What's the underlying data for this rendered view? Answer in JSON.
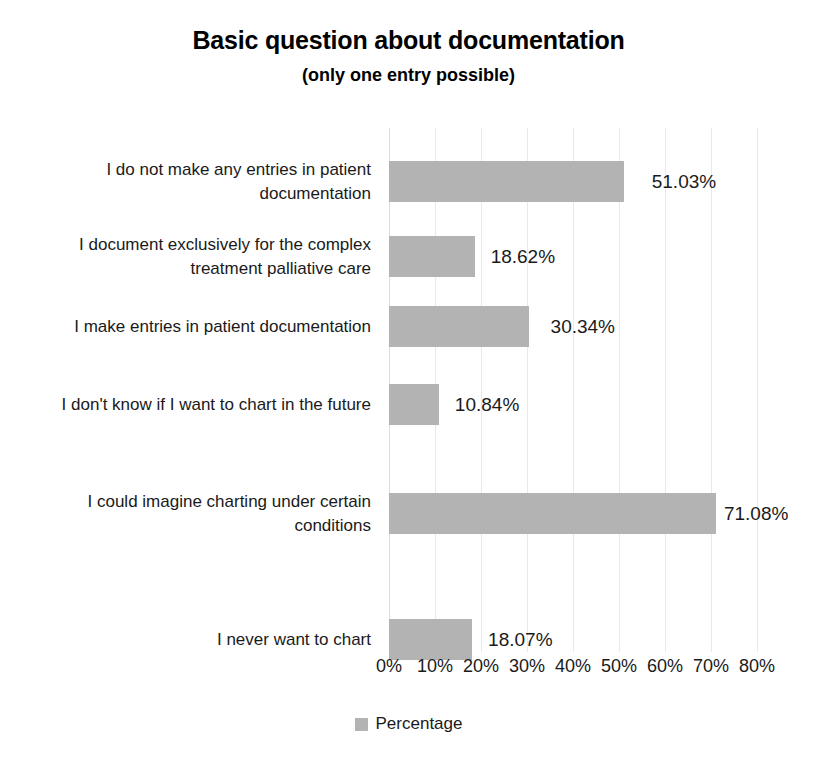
{
  "chart_data": {
    "type": "bar",
    "orientation": "horizontal",
    "title": "Basic question about documentation",
    "subtitle": "(only one entry possible)",
    "xlabel": "",
    "ylabel": "",
    "xlim": [
      0,
      80
    ],
    "xtick_labels": [
      "0%",
      "10%",
      "20%",
      "30%",
      "40%",
      "50%",
      "60%",
      "70%",
      "80%"
    ],
    "xtick_values": [
      0,
      10,
      20,
      30,
      40,
      50,
      60,
      70,
      80
    ],
    "grid": true,
    "legend_position": "bottom",
    "bar_color": "#b3b3b3",
    "categories": [
      "I do not make any entries in patient documentation",
      "I document exclusively for the complex treatment palliative care",
      "I make entries in patient documentation",
      "I don't know if I want to chart in the future",
      "I could imagine charting under certain conditions",
      "I never want to chart"
    ],
    "series": [
      {
        "name": "Percentage",
        "values": [
          51.03,
          18.62,
          30.34,
          10.84,
          71.08,
          18.07
        ],
        "value_labels": [
          "51.03%",
          "18.62%",
          "30.34%",
          "10.84%",
          "71.08%",
          "18.07%"
        ]
      }
    ]
  },
  "legend": {
    "entries": [
      {
        "label": "Percentage",
        "color": "#b3b3b3"
      }
    ]
  },
  "caption_fragment": ""
}
